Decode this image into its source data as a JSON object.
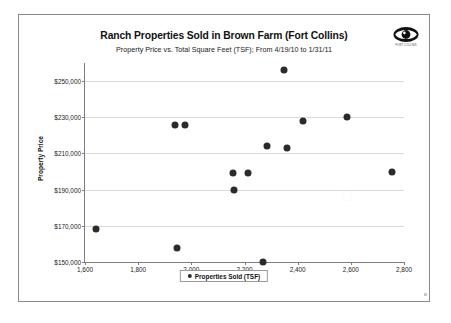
{
  "page": {
    "logo": {
      "icon": "eye-icon",
      "caption": "FORT COLLINS"
    },
    "title": "Ranch Properties Sold in Brown Farm (Fort Collins)",
    "subtitle": "Property Price vs. Total Square Feet (TSF); From 4/19/10 to 1/31/11",
    "watermark": "⌂"
  },
  "chart_data": {
    "type": "scatter",
    "title": "Ranch Properties Sold in Brown Farm (Fort Collins)",
    "subtitle": "Property Price vs. Total Square Feet (TSF); From 4/19/10 to 1/31/11",
    "xlabel": "",
    "ylabel": "Property Price",
    "xlim": [
      1600,
      2800
    ],
    "ylim": [
      150000,
      260000
    ],
    "xticks": [
      1600,
      1800,
      2000,
      2200,
      2400,
      2600,
      2800
    ],
    "xticklabels": [
      "1,600",
      "1,800",
      "2,000",
      "2,200",
      "2,400",
      "2,600",
      "2,800"
    ],
    "yticks": [
      150000,
      170000,
      190000,
      210000,
      230000,
      250000
    ],
    "yticklabels": [
      "$150,000",
      "$170,000",
      "$190,000",
      "$210,000",
      "$230,000",
      "$250,000"
    ],
    "grid": "horizontal",
    "legend_position": "bottom",
    "series": [
      {
        "name": "Properties Sold  (TSF)",
        "marker": "circle",
        "color": "#2b2b2b",
        "points": [
          {
            "x": 1640,
            "y": 168000
          },
          {
            "x": 1940,
            "y": 226000
          },
          {
            "x": 1945,
            "y": 158000
          },
          {
            "x": 1975,
            "y": 226000
          },
          {
            "x": 2155,
            "y": 199000
          },
          {
            "x": 2160,
            "y": 190000
          },
          {
            "x": 2215,
            "y": 199000
          },
          {
            "x": 2270,
            "y": 150000
          },
          {
            "x": 2285,
            "y": 214000
          },
          {
            "x": 2350,
            "y": 256000
          },
          {
            "x": 2360,
            "y": 213000
          },
          {
            "x": 2420,
            "y": 228000
          },
          {
            "x": 2585,
            "y": 230000
          },
          {
            "x": 2755,
            "y": 200000
          }
        ]
      }
    ]
  },
  "legend": {
    "label": "Properties Sold  (TSF)"
  }
}
